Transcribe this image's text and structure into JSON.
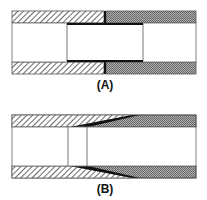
{
  "figures": [
    {
      "id": "A",
      "label": "(A)",
      "description": "Straight pipe joint with internal sleeve; left pipe diagonal-hatched, right pipe stippled, thick black butt joint"
    },
    {
      "id": "B",
      "label": "(B)",
      "description": "Tapered (scarf) pipe joint; left pipe diagonal-hatched, right pipe stippled, black wedge-shaped bond line"
    }
  ],
  "colors": {
    "hatch_line": "#444444",
    "stipple": "#8a8a8a",
    "bond": "#111111",
    "outline": "#555555",
    "background": "#ffffff"
  }
}
